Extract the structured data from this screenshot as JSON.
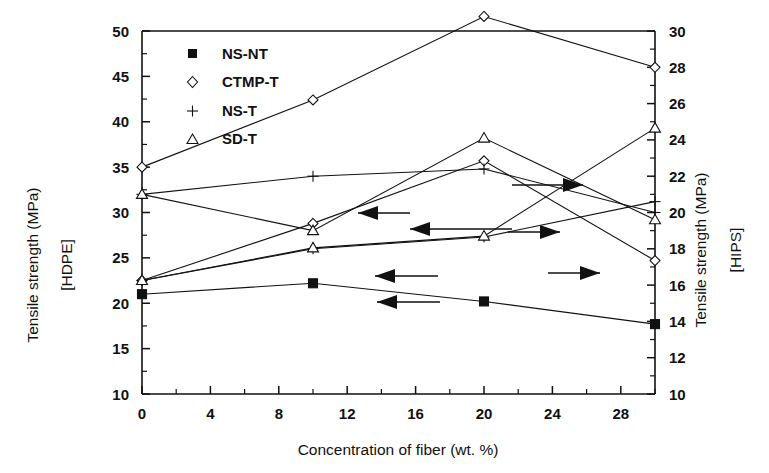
{
  "chart_data": {
    "type": "line",
    "title": "",
    "xlabel": "Concentration of fiber (wt. %)",
    "ylabel": "Tensile strength (MPa)",
    "ylabel_sub": "[HDPE]",
    "y2label": "Tensile strength (MPa)",
    "y2label_sub": "[HIPS]",
    "xlim": [
      0,
      30
    ],
    "ylim": [
      10,
      50
    ],
    "y2lim": [
      10,
      30
    ],
    "xticks": [
      0,
      4,
      8,
      12,
      16,
      20,
      24,
      28
    ],
    "yticks": [
      10,
      15,
      20,
      25,
      30,
      35,
      40,
      45,
      50
    ],
    "y2ticks": [
      10,
      12,
      14,
      16,
      18,
      20,
      22,
      24,
      26,
      28,
      30
    ],
    "xticklabels": [
      "0",
      "4",
      "8",
      "12",
      "16",
      "20",
      "24",
      "28"
    ],
    "yticklabels": [
      "10",
      "15",
      "20",
      "25",
      "30",
      "35",
      "40",
      "45",
      "50"
    ],
    "y2ticklabels": [
      "10",
      "12",
      "14",
      "16",
      "18",
      "20",
      "22",
      "24",
      "26",
      "28",
      "30"
    ],
    "grid": false,
    "legend_position": "upper-left",
    "axis_note": "Left axis = HDPE scale (10-50 MPa); right axis = HIPS scale (10-30 MPa). Arrows indicate which axis each curve belongs to.",
    "legend": [
      {
        "name": "NS-NT",
        "marker": "filled-square"
      },
      {
        "name": "CTMP-T",
        "marker": "open-diamond"
      },
      {
        "name": "NS-T",
        "marker": "plus"
      },
      {
        "name": "SD-T",
        "marker": "open-triangle"
      }
    ],
    "series": [
      {
        "name": "NS-NT",
        "marker": "filled-square",
        "axis": "left",
        "x": [
          0,
          10,
          20,
          30
        ],
        "values": [
          21.0,
          22.2,
          20.2,
          17.7
        ]
      },
      {
        "name": "CTMP-T",
        "marker": "open-diamond",
        "axis": "left",
        "x": [
          0,
          10,
          20,
          30
        ],
        "values": [
          22.5,
          28.8,
          35.7,
          24.7
        ]
      },
      {
        "name": "CTMP-T",
        "marker": "open-diamond",
        "axis": "right",
        "x": [
          0,
          10,
          20,
          30
        ],
        "values": [
          22.5,
          26.2,
          30.8,
          28.0
        ]
      },
      {
        "name": "NS-T",
        "marker": "plus",
        "axis": "left",
        "x": [
          0,
          10,
          20,
          30
        ],
        "values": [
          22.5,
          26.0,
          27.3,
          31.2
        ]
      },
      {
        "name": "NS-T",
        "marker": "plus",
        "axis": "right",
        "x": [
          0,
          10,
          20,
          30
        ],
        "values": [
          21.0,
          22.0,
          22.4,
          20.0
        ]
      },
      {
        "name": "SD-T",
        "marker": "open-triangle",
        "axis": "left",
        "x": [
          0,
          10,
          20,
          30
        ],
        "values": [
          22.5,
          26.1,
          27.4,
          39.3
        ]
      },
      {
        "name": "SD-T",
        "marker": "open-triangle",
        "axis": "right",
        "x": [
          0,
          10,
          20,
          30
        ],
        "values": [
          21.0,
          19.0,
          24.1,
          19.6
        ]
      }
    ],
    "annotations": [
      {
        "type": "arrow",
        "direction": "left",
        "label": ""
      },
      {
        "type": "arrow",
        "direction": "left",
        "label": ""
      },
      {
        "type": "arrow",
        "direction": "left",
        "label": ""
      },
      {
        "type": "arrow",
        "direction": "right",
        "label": ""
      },
      {
        "type": "arrow",
        "direction": "right",
        "label": ""
      },
      {
        "type": "arrow",
        "direction": "right",
        "label": ""
      }
    ]
  }
}
